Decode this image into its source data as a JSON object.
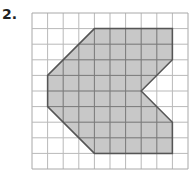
{
  "problem": {
    "number_label": "2."
  },
  "grid": {
    "columns": 10,
    "rows": 10,
    "origin_x": 32,
    "origin_y": 13,
    "cell_size": 15.6,
    "line_color": "#b9b9b9",
    "border_color": "#a8a8a8"
  },
  "shape": {
    "fill": "#c8c8c8",
    "stroke": "#555555",
    "vertices_grid": [
      [
        4,
        1
      ],
      [
        9,
        1
      ],
      [
        9,
        3
      ],
      [
        7,
        5
      ],
      [
        9,
        7
      ],
      [
        9,
        9
      ],
      [
        4,
        9
      ],
      [
        1,
        6
      ],
      [
        1,
        4
      ]
    ]
  }
}
